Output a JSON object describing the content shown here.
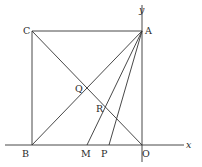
{
  "figure": {
    "type": "geometry",
    "axes": {
      "x_label": "x",
      "y_label": "y"
    },
    "points": {
      "O": {
        "label": "O",
        "px": [
          142,
          145
        ]
      },
      "A": {
        "label": "A",
        "px": [
          142,
          31
        ]
      },
      "C": {
        "label": "C",
        "px": [
          32,
          31
        ]
      },
      "B": {
        "label": "B",
        "px": [
          32,
          145
        ]
      },
      "M": {
        "label": "M",
        "px": [
          87,
          145
        ]
      },
      "P": {
        "label": "P",
        "px": [
          109,
          145
        ]
      },
      "Q": {
        "label": "Q",
        "px": [
          87,
          88
        ]
      },
      "R": {
        "label": "R",
        "px": [
          104,
          107
        ]
      }
    },
    "segments": [
      [
        "C",
        "A"
      ],
      [
        "C",
        "B"
      ],
      [
        "C",
        "O"
      ],
      [
        "A",
        "B"
      ],
      [
        "A",
        "M"
      ],
      [
        "A",
        "P"
      ]
    ],
    "colors": {
      "line": "#333333",
      "background": "#ffffff"
    }
  }
}
